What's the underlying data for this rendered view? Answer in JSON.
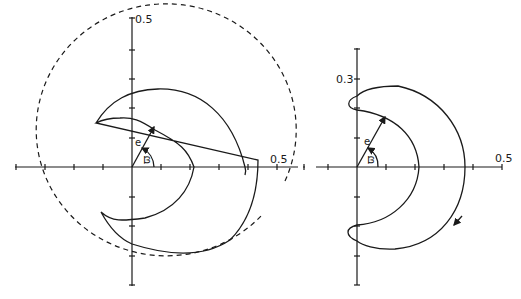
{
  "figure": {
    "left_panel": {
      "y_axis_label": "0.5",
      "x_axis_label": "0.5",
      "vector_label": "e",
      "angle_label": "ϖ",
      "has_dashed_circle": true
    },
    "right_panel": {
      "y_axis_label": "0.3",
      "x_axis_label": "0.5",
      "vector_label": "e",
      "angle_label": "ϖ",
      "direction_arrow": "clockwise"
    }
  },
  "colors": {
    "ink": "#1a1a1a",
    "background": "#ffffff"
  }
}
